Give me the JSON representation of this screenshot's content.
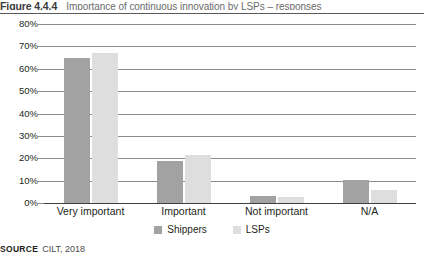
{
  "figure": {
    "number": "Figure 4.4.4",
    "caption": "Importance of continuous innovation by LSPs – responses",
    "source_keyword": "SOURCE",
    "source_text": "CILT, 2018"
  },
  "colors": {
    "shippers": "#a2a2a2",
    "lsps": "#dedede",
    "gridline": "#8c8c8c",
    "axis": "#3f3f3f",
    "rule": "#595959"
  },
  "legend": {
    "position": "bottom-center",
    "entries": [
      {
        "label": "Shippers",
        "color": "#a2a2a2"
      },
      {
        "label": "LSPs",
        "color": "#dedede"
      }
    ]
  },
  "chart_data": {
    "type": "bar",
    "title": "Importance of continuous innovation by LSPs – responses",
    "xlabel": "",
    "ylabel": "",
    "ylim": [
      0,
      80
    ],
    "ytick_step": 10,
    "grid": true,
    "legend_position": "bottom-center",
    "categories": [
      "Very important",
      "Important",
      "Not important",
      "N/A"
    ],
    "ytick_labels": [
      "0%",
      "10%",
      "20%",
      "30%",
      "40%",
      "50%",
      "60%",
      "70%",
      "80%"
    ],
    "ytick_values": [
      0,
      10,
      20,
      30,
      40,
      50,
      60,
      70,
      80
    ],
    "series": [
      {
        "name": "Shippers",
        "color": "#a2a2a2",
        "values": [
          65,
          19,
          3,
          10.5
        ]
      },
      {
        "name": "LSPs",
        "color": "#dedede",
        "values": [
          67,
          21.5,
          2.5,
          6
        ]
      }
    ]
  }
}
